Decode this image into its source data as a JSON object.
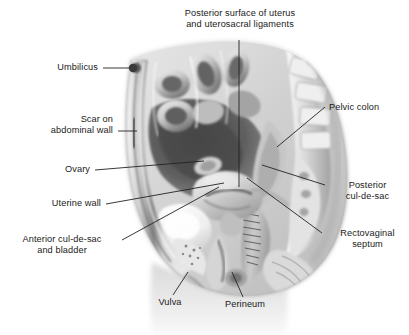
{
  "figure": {
    "background_color": "#ffffff",
    "text_color": "#1a1a1a",
    "leader_color": "#222222",
    "width": 409,
    "height": 335
  },
  "labels": {
    "posterior_surface_uterus": {
      "line1": "Posterior surface of uterus",
      "line2": "and uterosacral ligaments"
    },
    "umbilicus": {
      "text": "Umbilicus"
    },
    "scar_abdominal_wall": {
      "line1": "Scar on",
      "line2": "abdominal wall"
    },
    "ovary": {
      "text": "Ovary"
    },
    "uterine_wall": {
      "text": "Uterine wall"
    },
    "anterior_cul_de_sac": {
      "line1": "Anterior cul-de-sac",
      "line2": "and bladder"
    },
    "vulva": {
      "text": "Vulva"
    },
    "perineum": {
      "text": "Perineum"
    },
    "pelvic_colon": {
      "text": "Pelvic colon"
    },
    "posterior_cul_de_sac": {
      "line1": "Posterior",
      "line2": "cul-de-sac"
    },
    "rectovaginal_septum": {
      "line1": "Rectovaginal",
      "line2": "septum"
    }
  }
}
